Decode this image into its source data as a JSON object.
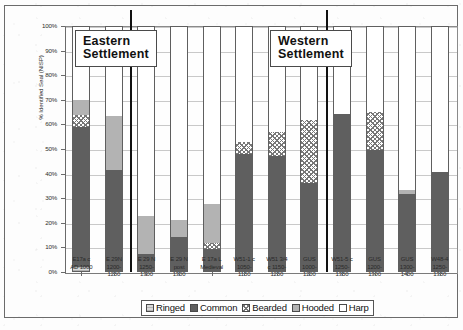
{
  "chart_data": {
    "type": "bar",
    "subtype": "stacked-percentage-column",
    "title": "",
    "xlabel": "",
    "ylabel": "% Identified Seal (NISP)",
    "ylim": [
      0,
      100
    ],
    "ytick_labels": [
      "100%",
      "90%",
      "80%",
      "70%",
      "60%",
      "50%",
      "40%",
      "30%",
      "20%",
      "10%",
      "0%"
    ],
    "ytick_values": [
      100,
      90,
      80,
      70,
      60,
      50,
      40,
      30,
      20,
      10,
      0
    ],
    "grid": true,
    "legend_position": "bottom",
    "categories": [
      "E17a c AD 1000",
      "E 29N 1200-1250",
      "E 29 N 1250-1300",
      "E 29 N post 1300",
      "E 17a L Medieval",
      "W51-1 c 1050-1150",
      "W51 3/4 c 1150-1250",
      "GUS 1000-1200",
      "W51-5 c 1250-1350",
      "GUS 1200-1300",
      "GUS 1300-1400",
      "W48-4 1250-1350"
    ],
    "category_lines": [
      [
        "E17a c",
        "AD 1000"
      ],
      [
        "E 29N",
        "1200-",
        "1250"
      ],
      [
        "E 29 N",
        "1250-",
        "1300"
      ],
      [
        "E 29 N",
        "post",
        "1300"
      ],
      [
        "E 17a L",
        "Medieval"
      ],
      [
        "W51-1 c",
        "1050-",
        "1150"
      ],
      [
        "W51 3/4",
        "c 1150-",
        "1250"
      ],
      [
        "GUS",
        "1000-",
        "1200"
      ],
      [
        "W51-5 c",
        "1250-",
        "1350"
      ],
      [
        "GUS",
        "1200-",
        "1300"
      ],
      [
        "GUS",
        "1300-",
        "1400"
      ],
      [
        "W48-4",
        "1250-",
        "1350"
      ]
    ],
    "series": [
      {
        "name": "Ringed",
        "values": [
          1.5,
          0,
          0,
          0,
          0,
          0,
          0,
          0,
          0,
          0,
          0,
          0
        ]
      },
      {
        "name": "Common",
        "values": [
          57.5,
          41.5,
          7.0,
          14.0,
          9.0,
          48.0,
          47.0,
          36.0,
          64.5,
          49.5,
          31.5,
          40.5
        ]
      },
      {
        "name": "Bearded",
        "values": [
          5.0,
          0,
          0,
          0,
          2.5,
          5.0,
          10.0,
          26.0,
          0,
          15.5,
          0,
          0
        ]
      },
      {
        "name": "Hooded",
        "values": [
          6.0,
          22.0,
          15.5,
          7.0,
          16.0,
          0,
          0,
          0,
          0,
          0,
          1.5,
          0
        ]
      },
      {
        "name": "Harp",
        "values": [
          30.0,
          36.5,
          77.5,
          79.0,
          72.5,
          47.0,
          43.0,
          38.0,
          35.5,
          35.0,
          67.0,
          59.5
        ]
      }
    ],
    "legend_entries": [
      {
        "label": "Ringed",
        "pattern": "light-gray-hatch"
      },
      {
        "label": "Common",
        "pattern": "solid-dark-gray"
      },
      {
        "label": "Bearded",
        "pattern": "crosshatch"
      },
      {
        "label": "Hooded",
        "pattern": "medium-gray"
      },
      {
        "label": "Harp",
        "pattern": "white"
      }
    ],
    "annotations": [
      {
        "text": "Eastern\nSettlement",
        "line1": "Eastern",
        "line2": "Settlement",
        "group": "east"
      },
      {
        "text": "Western\nSettlement",
        "line1": "Western",
        "line2": "Settlement",
        "group": "west"
      }
    ],
    "group_dividers": 2
  }
}
